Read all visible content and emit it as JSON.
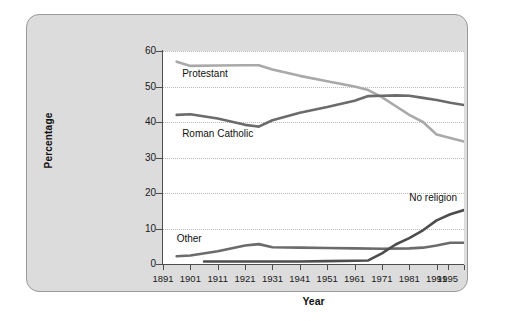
{
  "chart_data": {
    "type": "line",
    "title": "",
    "xlabel": "Year",
    "ylabel": "Percentage",
    "ylim": [
      0,
      60
    ],
    "yticks": [
      0,
      10,
      20,
      30,
      40,
      50,
      60
    ],
    "xlim": [
      1891,
      2001
    ],
    "xticks": [
      1891,
      1901,
      1911,
      1921,
      1931,
      1941,
      1951,
      1961,
      1971,
      1981,
      1991,
      1995
    ],
    "xtick_labels": [
      "1891",
      "1901",
      "1911",
      "1921",
      "1931",
      "1941",
      "1951",
      "1961",
      "1971",
      "1981",
      "1991",
      "1995"
    ],
    "grid": "horizontal-dotted",
    "legend": "inline-annotations",
    "series": [
      {
        "name": "Protestant",
        "color": "#a9a9a9",
        "label_x": 1898,
        "label_y": 53.5,
        "x": [
          1896,
          1901,
          1911,
          1921,
          1926,
          1931,
          1941,
          1951,
          1961,
          1966,
          1971,
          1976,
          1981,
          1986,
          1991,
          1996,
          2001
        ],
        "y": [
          57.0,
          55.8,
          55.9,
          56.0,
          56.0,
          54.8,
          53.0,
          51.5,
          50.0,
          49.0,
          47.0,
          44.5,
          42.0,
          40.0,
          36.5,
          35.5,
          34.5
        ]
      },
      {
        "name": "Roman Catholic",
        "color": "#6b6b6b",
        "label_x": 1898,
        "label_y": 36.5,
        "x": [
          1896,
          1901,
          1911,
          1921,
          1926,
          1931,
          1941,
          1951,
          1961,
          1966,
          1971,
          1976,
          1981,
          1986,
          1991,
          1996,
          2001
        ],
        "y": [
          42.0,
          42.2,
          41.0,
          39.2,
          38.7,
          40.5,
          42.6,
          44.2,
          46.0,
          47.3,
          47.4,
          47.5,
          47.4,
          46.8,
          46.2,
          45.4,
          44.8
        ]
      },
      {
        "name": "Other",
        "color": "#6b6b6b",
        "label_x": 1896,
        "label_y": 7.0,
        "x": [
          1896,
          1901,
          1911,
          1921,
          1926,
          1931,
          1941,
          1951,
          1961,
          1971,
          1981,
          1986,
          1991,
          1996,
          2001
        ],
        "y": [
          2.2,
          2.4,
          3.6,
          5.2,
          5.6,
          4.7,
          4.6,
          4.5,
          4.4,
          4.3,
          4.4,
          4.6,
          5.2,
          6.0,
          6.0
        ]
      },
      {
        "name": "No religion",
        "color": "#4d4d4d",
        "label_x": 1981,
        "label_y": 18.5,
        "x": [
          1906,
          1911,
          1921,
          1931,
          1941,
          1951,
          1961,
          1966,
          1971,
          1976,
          1981,
          1986,
          1991,
          1996,
          2001
        ],
        "y": [
          0.7,
          0.7,
          0.7,
          0.7,
          0.7,
          0.8,
          0.9,
          1.0,
          3.0,
          5.5,
          7.3,
          9.5,
          12.3,
          14.0,
          15.2
        ]
      }
    ]
  }
}
